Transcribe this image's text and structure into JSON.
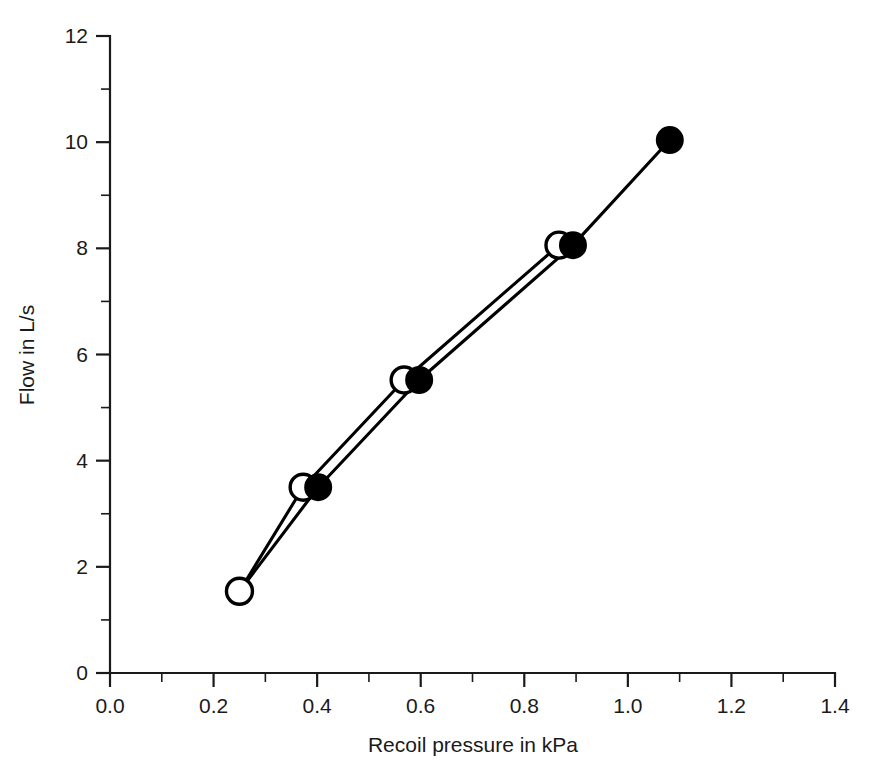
{
  "chart_data": {
    "type": "scatter",
    "title": "",
    "subtitle": "",
    "xlabel": "Recoil pressure in kPa",
    "ylabel": "Flow in L/s",
    "xlim": [
      0.0,
      1.4
    ],
    "ylim": [
      0,
      12
    ],
    "grid": false,
    "legend": "none",
    "x_ticks": [
      "0.0",
      "0.2",
      "0.4",
      "0.6",
      "0.8",
      "1.0",
      "1.2",
      "1.4"
    ],
    "x_tick_values": [
      0.0,
      0.2,
      0.4,
      0.6,
      0.8,
      1.0,
      1.2,
      1.4
    ],
    "x_minor_step": 0.1,
    "y_ticks": [
      "0",
      "2",
      "4",
      "6",
      "8",
      "10",
      "12"
    ],
    "y_tick_values": [
      0,
      2,
      4,
      6,
      8,
      10,
      12
    ],
    "y_minor_step": 1,
    "series": [
      {
        "name": "open-circle-series",
        "marker": "open-circle",
        "marker_fill": "#ffffff",
        "marker_stroke": "#000000",
        "line_color": "#000000",
        "points": [
          {
            "x": 0.25,
            "y": 1.54
          },
          {
            "x": 0.373,
            "y": 3.5
          },
          {
            "x": 0.568,
            "y": 5.52
          },
          {
            "x": 0.867,
            "y": 8.06
          }
        ]
      },
      {
        "name": "filled-circle-series",
        "marker": "filled-circle",
        "marker_fill": "#000000",
        "marker_stroke": "#000000",
        "line_color": "#000000",
        "points": [
          {
            "x": 0.402,
            "y": 3.5
          },
          {
            "x": 0.597,
            "y": 5.52
          },
          {
            "x": 0.894,
            "y": 8.06
          },
          {
            "x": 1.081,
            "y": 10.04
          }
        ]
      }
    ],
    "connector": {
      "description": "open series first point connects upward to open series second point; the two series are joined at the low end",
      "from": {
        "x": 0.25,
        "y": 1.54
      },
      "to": {
        "x": 0.402,
        "y": 3.5
      }
    },
    "colors": {
      "axis": "#1a1a1a",
      "line": "#000000",
      "background": "#ffffff"
    }
  },
  "figure": {
    "background_color": "#ffffff"
  }
}
